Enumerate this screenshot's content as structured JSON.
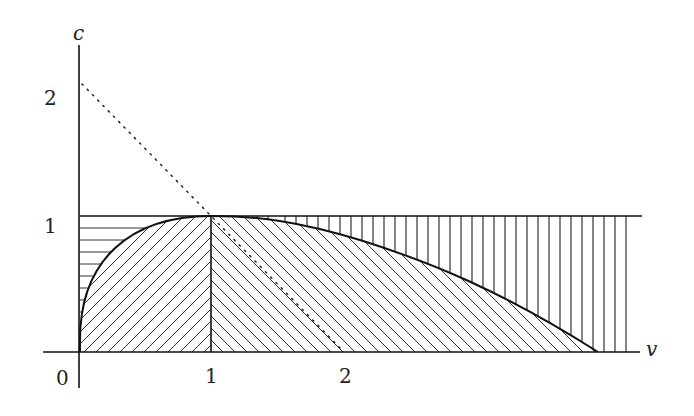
{
  "diagram": {
    "axes": {
      "x_label": "v",
      "y_label": "c",
      "origin_label": "0",
      "x_ticks": [
        {
          "value": 1,
          "label": "1"
        },
        {
          "value": 2,
          "label": "2"
        }
      ],
      "y_ticks": [
        {
          "value": 1,
          "label": "1"
        },
        {
          "value": 2,
          "label": "2"
        }
      ]
    },
    "elements": [
      {
        "name": "horizontal-line-c1",
        "description": "Horizontal line c = 1 from v = 0 to v ≈ 4.3"
      },
      {
        "name": "vertical-line-v1",
        "description": "Vertical segment at v = 1 from c = 0 to c = 1"
      },
      {
        "name": "dotted-line",
        "description": "Dotted line c = 2 - v from (0,2) to (2,0)"
      },
      {
        "name": "curve",
        "description": "Curve rising from origin to peak (1,1), then decaying to c = 0 at v ≈ 3.9"
      }
    ],
    "regions": [
      {
        "name": "region-horizontal-hatch",
        "hatch": "horizontal",
        "description": "Between curve and c = 1 for 0 < v < 1"
      },
      {
        "name": "region-diagonal-hatch-left",
        "hatch": "diagonal /",
        "description": "Under curve for 0 < v < 1"
      },
      {
        "name": "region-diagonal-hatch-right",
        "hatch": "diagonal \\",
        "description": "Under curve for v > 1"
      },
      {
        "name": "region-vertical-hatch",
        "hatch": "vertical",
        "description": "Between curve and c = 1 for v > 1"
      }
    ]
  }
}
